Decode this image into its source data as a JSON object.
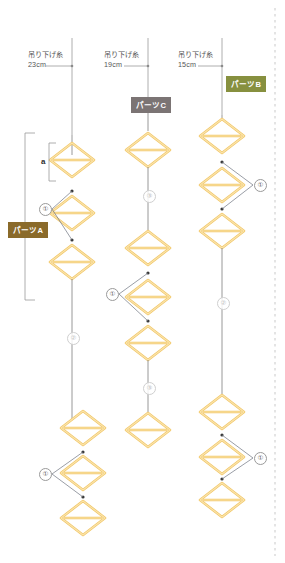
{
  "diagram": {
    "title_hidden": "",
    "colors": {
      "diamond": "#f3c96b",
      "diamond_light": "#f7dfa0",
      "thread": "#8d8d8d",
      "leader": "#6f7480",
      "bracket": "#9b9b9b",
      "badge_a": "#8a6a2a",
      "badge_b": "#87903f",
      "badge_c": "#7b7474",
      "dashed_edge": "#c9c9c9"
    },
    "dimensions": [
      {
        "id": "dim-left",
        "label": "吊り下げ糸",
        "value": "23cm"
      },
      {
        "id": "dim-middle",
        "label": "吊り下げ糸",
        "value": "19cm"
      },
      {
        "id": "dim-right",
        "label": "吊り下げ糸",
        "value": "15cm"
      }
    ],
    "badges": [
      {
        "id": "parts-a",
        "text": "パーツA"
      },
      {
        "id": "parts-b",
        "text": "パーツB"
      },
      {
        "id": "parts-c",
        "text": "パーツC"
      }
    ],
    "bracket_labels": [
      {
        "id": "segment-a",
        "text": "a"
      }
    ],
    "callouts": [
      {
        "id": "left-upper-1",
        "text": "①"
      },
      {
        "id": "left-lower-1",
        "text": "①"
      },
      {
        "id": "left-thread-2",
        "text": "②"
      },
      {
        "id": "middle-upper-3",
        "text": "③"
      },
      {
        "id": "middle-mid-1",
        "text": "①"
      },
      {
        "id": "middle-lower-3",
        "text": "③"
      },
      {
        "id": "right-upper-1",
        "text": "①"
      },
      {
        "id": "right-thread-2",
        "text": "②"
      },
      {
        "id": "right-lower-1",
        "text": "①"
      }
    ]
  }
}
